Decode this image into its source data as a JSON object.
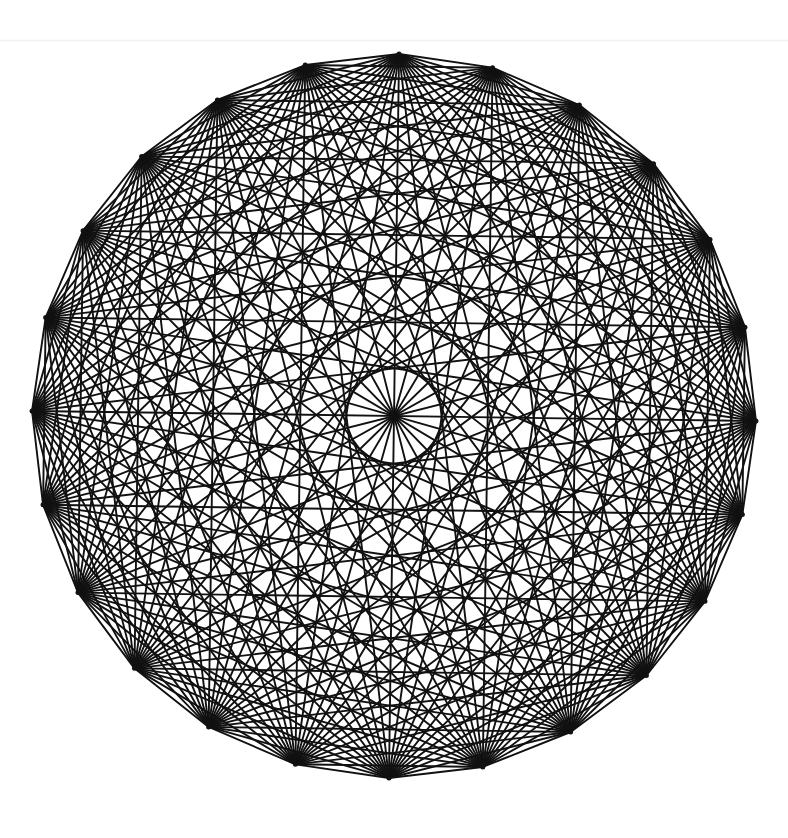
{
  "diagram": {
    "title": "Complete graph K24",
    "type": "complete-graph",
    "vertex_count": 24,
    "center": [
      394,
      416
    ],
    "radius": 362,
    "rotation_deg": 0.8,
    "stroke_color": "#111111",
    "stroke_width": 1.9,
    "background_color": "#ffffff",
    "edge_count": 276
  }
}
